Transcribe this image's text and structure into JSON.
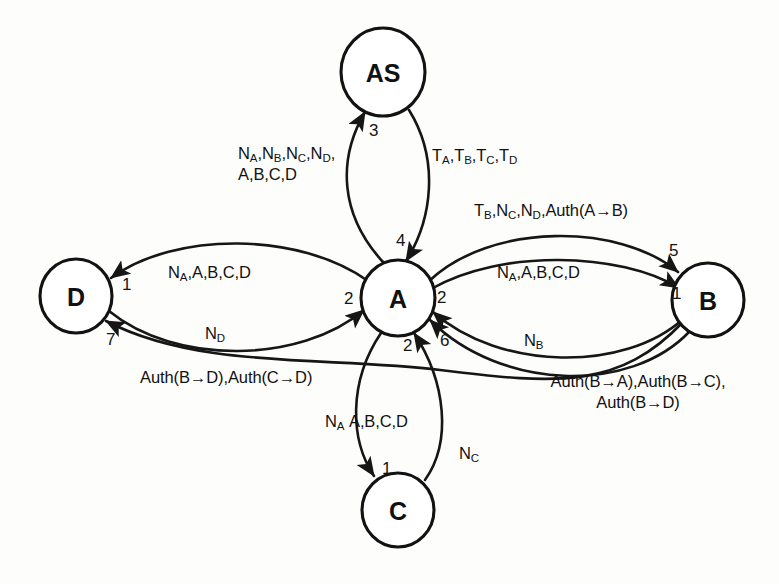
{
  "diagram": {
    "type": "protocol-message-sequence-graph",
    "background_color": "#fdfdfb",
    "stroke_color": "#161616",
    "nodes": [
      {
        "id": "AS",
        "label": "AS",
        "cx": 383,
        "cy": 72,
        "rx": 42,
        "ry": 44
      },
      {
        "id": "A",
        "label": "A",
        "cx": 398,
        "cy": 298,
        "rx": 37,
        "ry": 38
      },
      {
        "id": "D",
        "label": "D",
        "cx": 76,
        "cy": 296,
        "rx": 36,
        "ry": 37
      },
      {
        "id": "B",
        "label": "B",
        "cx": 708,
        "cy": 300,
        "rx": 36,
        "ry": 37
      },
      {
        "id": "C",
        "label": "C",
        "cx": 398,
        "cy": 510,
        "rx": 36,
        "ry": 37
      }
    ],
    "edges": [
      {
        "from": "A",
        "to": "AS",
        "seq": "3",
        "label_lines": [
          "N_A,N_B,N_C,N_D,",
          "A,B,C,D"
        ]
      },
      {
        "from": "AS",
        "to": "A",
        "seq": "4",
        "label_lines": [
          "T_A,T_B,T_C,T_D"
        ]
      },
      {
        "from": "A",
        "to": "D",
        "seq": "1",
        "label_lines": [
          "N_A,A,B,C,D"
        ]
      },
      {
        "from": "D",
        "to": "A",
        "seq": "2",
        "label_lines": [
          "N_D"
        ]
      },
      {
        "from": "B",
        "to": "D",
        "seq": "7",
        "label_lines": [
          "Auth(B→D),Auth(C→D)"
        ]
      },
      {
        "from": "A",
        "to": "B",
        "seq": "1",
        "label_lines": [
          "N_A,A,B,C,D"
        ]
      },
      {
        "from": "A",
        "to": "B",
        "seq": "5",
        "label_lines": [
          "T_B,N_C,N_D,Auth(A→B)"
        ]
      },
      {
        "from": "B",
        "to": "A",
        "seq": "2",
        "label_lines": [
          "N_B"
        ]
      },
      {
        "from": "B",
        "to": "A",
        "seq": "6",
        "label_lines": [
          "Auth(B→A),Auth(B→C),",
          "Auth(B→D)"
        ]
      },
      {
        "from": "A",
        "to": "C",
        "seq": "1",
        "label_lines": [
          "N_A,A,B,C,D"
        ]
      },
      {
        "from": "C",
        "to": "A",
        "seq": "2",
        "label_lines": [
          "N_C"
        ]
      }
    ]
  },
  "nodes": {
    "as": "AS",
    "a": "A",
    "b": "B",
    "c": "C",
    "d": "D"
  },
  "seq": {
    "a_to_as": "3",
    "as_to_a": "4",
    "a_to_d": "1",
    "d_to_a": "2",
    "b_to_d": "7",
    "a_to_b_1": "1",
    "a_to_b_5": "5",
    "b_to_a_2": "2",
    "b_to_a_6": "6",
    "a_to_c": "1",
    "c_to_a": "2"
  },
  "labels": {
    "a_to_as_line1_pre": "N",
    "a_to_as_line1": "N A ,N B ,N C ,N D ,",
    "a_to_as_line2": "A,B,C,D",
    "as_to_a": "T A ,T B ,T C ,T D",
    "a_to_d": "N A ,A,B,C,D",
    "d_to_a": "N D",
    "b_to_d": "Auth(B→D),Auth(C→D)",
    "a_to_b_upper": "T B ,N C ,N D ,Auth(A→B)",
    "a_to_b_lower": "N A ,A,B,C,D",
    "b_to_a_upper": "N B",
    "b_to_a_lower_line1": "Auth(B→A),Auth(B→C),",
    "b_to_a_lower_line2": "Auth(B→D)",
    "a_to_c_pre": "N A",
    "a_to_c_rest": "A,B,C,D",
    "c_to_a": "N C"
  }
}
